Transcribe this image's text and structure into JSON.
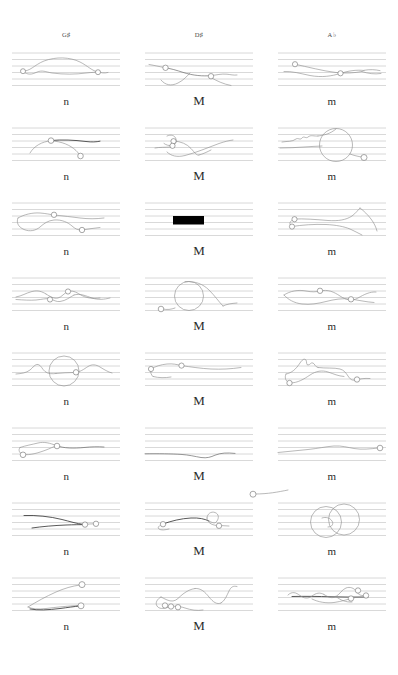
{
  "page": {
    "background_color": "#ffffff",
    "stroke_color": "#8e8e8e",
    "staffline_color": "#b9b9b9",
    "accent_color": "#000000",
    "columns": 3,
    "rows": 8,
    "staff_line_count": 6
  },
  "headers": [
    {
      "label": "G♯",
      "name": "column-header-g-sharp"
    },
    {
      "label": "D♯",
      "name": "column-header-d-sharp"
    },
    {
      "label": "A♭",
      "name": "column-header-a-flat"
    }
  ],
  "rows": [
    {
      "index": 1,
      "cells": [
        {
          "label": "n",
          "column": "G♯",
          "figure": "arch-curve-with-two-noteheads",
          "noteheads": 3,
          "special": "none"
        },
        {
          "label": "M",
          "column": "D♯",
          "figure": "descending-wave-with-noteheads",
          "noteheads": 2,
          "special": "none"
        },
        {
          "label": "m",
          "column": "A♭",
          "figure": "crossing-lens-curve",
          "noteheads": 2,
          "special": "none"
        }
      ]
    },
    {
      "index": 2,
      "cells": [
        {
          "label": "n",
          "column": "G♯",
          "figure": "dome-arc-with-flat-top",
          "noteheads": 2,
          "special": "none"
        },
        {
          "label": "M",
          "column": "D♯",
          "figure": "loop-and-rising-ramp",
          "noteheads": 2,
          "special": "none"
        },
        {
          "label": "m",
          "column": "A♭",
          "figure": "zigzag-into-large-circle",
          "noteheads": 1,
          "special": "large-circle"
        }
      ]
    },
    {
      "index": 3,
      "cells": [
        {
          "label": "n",
          "column": "G♯",
          "figure": "double-wave-loop",
          "noteheads": 2,
          "special": "none"
        },
        {
          "label": "M",
          "column": "D♯",
          "figure": "solid-black-bar",
          "noteheads": 0,
          "special": "black-bar"
        },
        {
          "label": "m",
          "column": "A♭",
          "figure": "rising-band-with-two-noteheads",
          "noteheads": 2,
          "special": "none"
        }
      ]
    },
    {
      "index": 4,
      "cells": [
        {
          "label": "n",
          "column": "G♯",
          "figure": "flat-wave-with-bumps",
          "noteheads": 2,
          "special": "none"
        },
        {
          "label": "M",
          "column": "D♯",
          "figure": "large-circle-with-tail",
          "noteheads": 1,
          "special": "large-circle"
        },
        {
          "label": "m",
          "column": "A♭",
          "figure": "twin-lobed-wave",
          "noteheads": 2,
          "special": "none"
        }
      ]
    },
    {
      "index": 5,
      "cells": [
        {
          "label": "n",
          "column": "G♯",
          "figure": "wave-through-large-circle",
          "noteheads": 1,
          "special": "large-circle"
        },
        {
          "label": "M",
          "column": "D♯",
          "figure": "low-plateau-curve",
          "noteheads": 2,
          "special": "none"
        },
        {
          "label": "m",
          "column": "A♭",
          "figure": "jagged-peak-descent",
          "noteheads": 2,
          "special": "none"
        }
      ]
    },
    {
      "index": 6,
      "cells": [
        {
          "label": "n",
          "column": "G♯",
          "figure": "loop-and-long-line",
          "noteheads": 2,
          "special": "none"
        },
        {
          "label": "M",
          "column": "D♯",
          "figure": "long-flat-line-to-edge",
          "noteheads": 1,
          "special": "connector-line"
        },
        {
          "label": "m",
          "column": "A♭",
          "figure": "flat-line-rising-to-edge",
          "noteheads": 1,
          "special": "connector-line"
        }
      ]
    },
    {
      "index": 7,
      "cells": [
        {
          "label": "n",
          "column": "G♯",
          "figure": "two-parallel-dark-strokes",
          "noteheads": 2,
          "special": "none"
        },
        {
          "label": "M",
          "column": "D♯",
          "figure": "rolling-hill-with-dip",
          "noteheads": 2,
          "special": "none"
        },
        {
          "label": "m",
          "column": "A♭",
          "figure": "two-overlapping-circles",
          "noteheads": 0,
          "special": "double-circle"
        }
      ]
    },
    {
      "index": 8,
      "cells": [
        {
          "label": "n",
          "column": "G♯",
          "figure": "rising-diagonal-with-low-stroke",
          "noteheads": 2,
          "special": "none"
        },
        {
          "label": "M",
          "column": "D♯",
          "figure": "tall-sine-with-cluster",
          "noteheads": 3,
          "special": "none"
        },
        {
          "label": "m",
          "column": "A♭",
          "figure": "dense-cluster-with-beam",
          "noteheads": 3,
          "special": "none"
        }
      ]
    }
  ]
}
